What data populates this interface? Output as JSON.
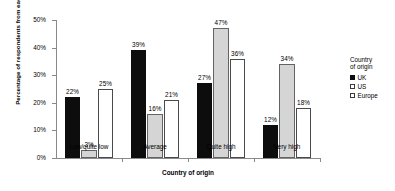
{
  "chart_data": {
    "type": "bar",
    "title": "",
    "xlabel": "Country of origin",
    "ylabel": "Percentage of respondents from each region",
    "categories": [
      "Low/quite low",
      "Average",
      "Quite high",
      "Very high"
    ],
    "series": [
      {
        "name": "UK",
        "color": "#0d0d0d",
        "values": [
          22,
          39,
          27,
          12
        ],
        "labels": [
          "22%",
          "39%",
          "27%",
          "12%"
        ]
      },
      {
        "name": "US",
        "color": "#d5d5d5",
        "values": [
          3,
          16,
          47,
          34
        ],
        "labels": [
          "3%",
          "16%",
          "47%",
          "34%"
        ]
      },
      {
        "name": "Europe",
        "color": "#ffffff",
        "values": [
          25,
          21,
          36,
          18
        ],
        "labels": [
          "25%",
          "21%",
          "36%",
          "18%"
        ]
      }
    ],
    "ylim": [
      0,
      50
    ],
    "ytick_values": [
      0,
      10,
      20,
      30,
      40,
      50
    ],
    "ytick_labels": [
      "0%",
      "10%",
      "20%",
      "30%",
      "40%",
      "50%"
    ],
    "grid": false,
    "legend_position": "right",
    "legend": {
      "title": "Country\nof origin",
      "entries": [
        "UK",
        "US",
        "Europe"
      ]
    }
  }
}
